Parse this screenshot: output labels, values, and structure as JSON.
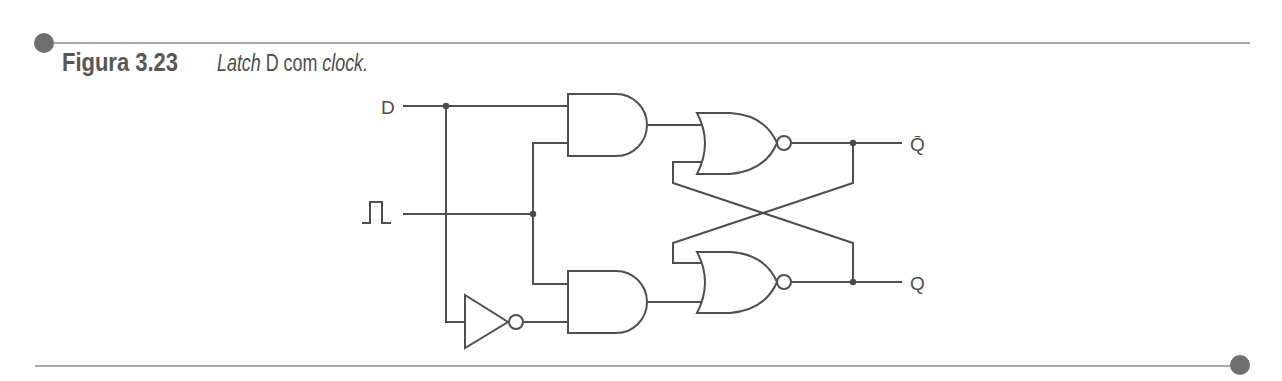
{
  "figure": {
    "number_label": "Figura 3.23",
    "caption": {
      "part1": "Latch",
      "part2": " D com ",
      "part3": "clock."
    }
  },
  "circuit": {
    "type": "gated D latch",
    "inputs": {
      "data": {
        "label": "D"
      },
      "clock": {
        "label": "clock",
        "symbol": "pulse-icon"
      }
    },
    "outputs": {
      "q_bar": {
        "label": "Q̄"
      },
      "q": {
        "label": "Q"
      }
    },
    "gates": [
      {
        "id": "not1",
        "type": "NOT",
        "input": "D",
        "output": "not D"
      },
      {
        "id": "and1",
        "type": "AND",
        "inputs": [
          "D",
          "clock"
        ]
      },
      {
        "id": "and2",
        "type": "AND",
        "inputs": [
          "clock",
          "not D"
        ]
      },
      {
        "id": "nor1",
        "type": "NOR",
        "inputs": [
          "and1",
          "Q"
        ],
        "output": "Q̄"
      },
      {
        "id": "nor2",
        "type": "NOR",
        "inputs": [
          "Q̄",
          "and2"
        ],
        "output": "Q"
      }
    ]
  },
  "colors": {
    "line": "#4f4f4f",
    "rule": "#8c8c8c",
    "rule_dot": "#6f6f6f",
    "text": "#4c4c4c"
  }
}
